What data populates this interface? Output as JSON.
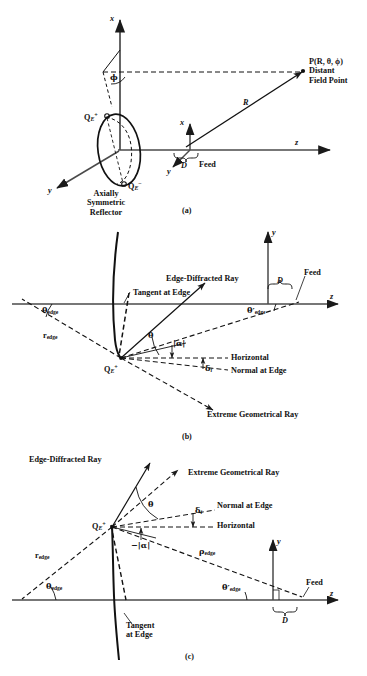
{
  "figure": {
    "panels": [
      "(a)",
      "(b)",
      "(c)"
    ]
  },
  "panel_a": {
    "caption": "(a)",
    "axis_x_top": "x",
    "axis_x_feed": "x",
    "axis_y_left": "y",
    "axis_y_feed": "y",
    "axis_z": "z",
    "angle_phi": "ϕ",
    "range_R": "R",
    "aperture_D": "D",
    "feed": "Feed",
    "edge_plus": "Q",
    "edge_plus_sub": "E",
    "edge_plus_sup": "+",
    "edge_minus": "Q",
    "edge_minus_sub": "E",
    "edge_minus_sup": "−",
    "field_point": "P(R, θ, ϕ)",
    "field_point_line2": "Distant",
    "field_point_line3": "Field Point",
    "reflector_l1": "Axially",
    "reflector_l2": "Symmetric",
    "reflector_l3": "Reflector"
  },
  "panel_b": {
    "caption": "(b)",
    "axis_y": "y",
    "axis_z": "z",
    "edge_point": "Q",
    "edge_point_sub": "E",
    "edge_point_sup": "+",
    "edge_diffracted_ray": "Edge-Diffracted Ray",
    "tangent_at_edge": "Tangent at Edge",
    "extreme_geometrical_ray": "Extreme Geometrical Ray",
    "horizontal": "Horizontal",
    "normal_at_edge": "Normal at Edge",
    "feed": "Feed",
    "aperture_D": "D",
    "theta": "θ",
    "alpha": "|α|",
    "delta_i": "δ",
    "delta_i_sub": "i",
    "theta_edge": "θ",
    "theta_edge_sub": "edge",
    "theta_prime_edge": "θ′",
    "theta_prime_edge_sub": "edge",
    "r_edge": "r",
    "r_edge_sub": "edge"
  },
  "panel_c": {
    "caption": "(c)",
    "axis_y": "y",
    "axis_z": "z",
    "edge_point": "Q",
    "edge_point_sub": "E",
    "edge_point_sup": "+",
    "edge_diffracted_ray": "Edge-Diffracted Ray",
    "extreme_geometrical_ray": "Extreme Geometrical Ray",
    "normal_at_edge": "Normal at Edge",
    "horizontal": "Horizontal",
    "tangent_l1": "Tangent",
    "tangent_l2": "at Edge",
    "feed": "Feed",
    "aperture_D": "D",
    "theta": "θ",
    "neg_alpha": "−|α|",
    "delta_i": "δ",
    "delta_i_sub": "i",
    "theta_edge": "θ",
    "theta_edge_sub": "edge",
    "theta_prime_edge": "θ′",
    "theta_prime_edge_sub": "edge",
    "r_edge": "r",
    "r_edge_sub": "edge",
    "rho_edge": "ρ",
    "rho_edge_sub": "edge"
  },
  "colors": {
    "ink": "#111111",
    "line": "#1a1a1a",
    "axis": "#3a3a3a",
    "background": "#ffffff"
  }
}
